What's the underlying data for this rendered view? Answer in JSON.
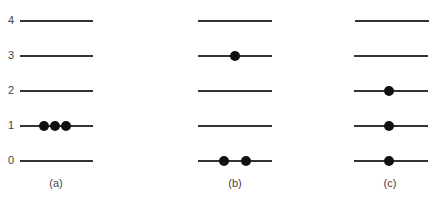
{
  "levels": [
    "0",
    "1",
    "2",
    "3",
    "4"
  ],
  "panels": [
    {
      "caption": "(a)",
      "occupancy": {
        "0": 0,
        "1": 3,
        "2": 0,
        "3": 0,
        "4": 0
      }
    },
    {
      "caption": "(b)",
      "occupancy": {
        "0": 2,
        "1": 0,
        "2": 0,
        "3": 1,
        "4": 0
      }
    },
    {
      "caption": "(c)",
      "occupancy": {
        "0": 1,
        "1": 1,
        "2": 1,
        "3": 0,
        "4": 0
      }
    }
  ]
}
